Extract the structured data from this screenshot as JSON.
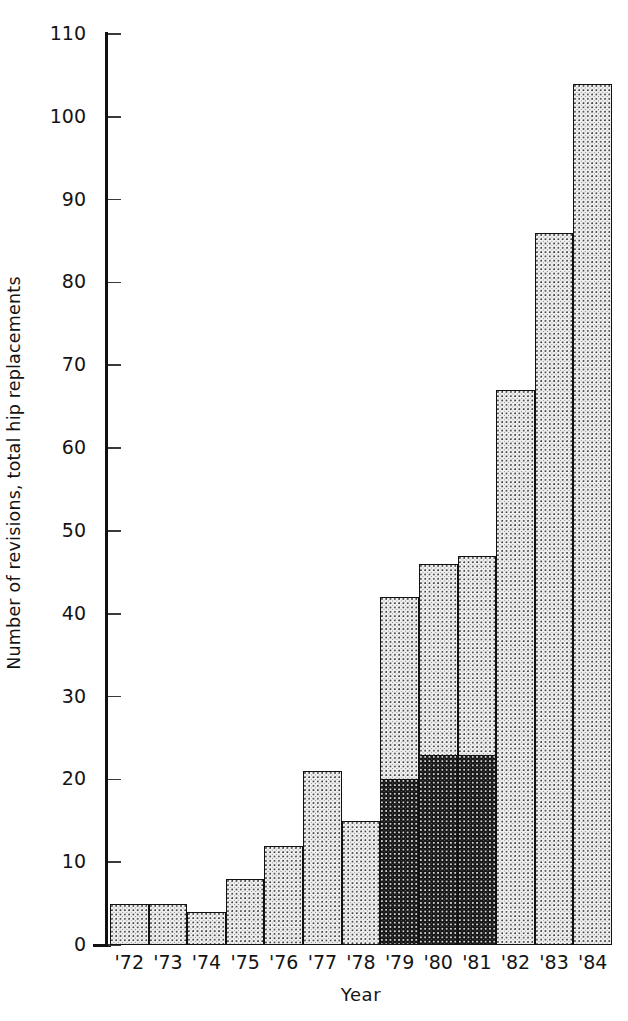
{
  "chart_data": {
    "type": "bar",
    "title": "",
    "subtitle": "",
    "xlabel": "Year",
    "ylabel": "Number of revisions, total hip replacements",
    "categories": [
      "'72",
      "'73",
      "'74",
      "'75",
      "'76",
      "'77",
      "'78",
      "'79",
      "'80",
      "'81",
      "'82",
      "'83",
      "'84"
    ],
    "values": [
      5,
      5,
      4,
      8,
      12,
      21,
      15,
      42,
      46,
      47,
      67,
      86,
      104
    ],
    "series": [
      {
        "name": "dark-shaded portion",
        "values": [
          0,
          0,
          0,
          0,
          0,
          0,
          0,
          20,
          23,
          23,
          0,
          0,
          0
        ]
      },
      {
        "name": "light-stippled portion",
        "values": [
          5,
          5,
          4,
          8,
          12,
          21,
          15,
          22,
          23,
          24,
          67,
          86,
          104
        ]
      }
    ],
    "ylim": [
      0,
      110
    ],
    "yticks": [
      0,
      10,
      20,
      30,
      40,
      50,
      60,
      70,
      80,
      90,
      100,
      110
    ],
    "ytick_labels": [
      "0",
      "10",
      "20",
      "30",
      "40",
      "50",
      "60",
      "70",
      "80",
      "90",
      "100",
      "110"
    ],
    "grid": false,
    "legend": "none",
    "stacked": true,
    "bar_gap": 0,
    "colors": {
      "light_fill": "#efefef",
      "dark_fill": "#171717",
      "outline": "#111111",
      "text": "#141414",
      "background": "#ffffff"
    }
  }
}
